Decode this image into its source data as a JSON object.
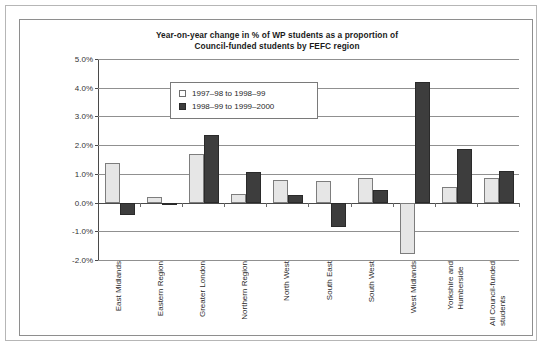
{
  "chart_data": {
    "type": "bar",
    "title": "Year-on-year change in % of WP students as a proportion of Council-funded students by FEFC region",
    "title_line1": "Year-on-year change in % of WP students as a proportion of",
    "title_line2": "Council-funded students by FEFC region",
    "xlabel": "",
    "ylabel": "",
    "ylim": [
      -2.0,
      5.0
    ],
    "ytick_step": 1.0,
    "yticks": [
      "5.0%",
      "4.0%",
      "3.0%",
      "2.0%",
      "1.0%",
      "0.0%",
      "-1.0%",
      "-2.0%"
    ],
    "ytick_values": [
      5.0,
      4.0,
      3.0,
      2.0,
      1.0,
      0.0,
      -1.0,
      -2.0
    ],
    "grid": true,
    "legend_position": "upper-left-inside",
    "categories": [
      "East Midlands",
      "Eastern Region",
      "Greater London",
      "Northern Region",
      "North West",
      "South East",
      "South West",
      "West Midlands",
      "Yorkshire and Humberside",
      "All Council-funded students"
    ],
    "category_lines": [
      [
        "East Midlands"
      ],
      [
        "Eastern Region"
      ],
      [
        "Greater London"
      ],
      [
        "Northern Region"
      ],
      [
        "North West"
      ],
      [
        "South East"
      ],
      [
        "South West"
      ],
      [
        "West Midlands"
      ],
      [
        "Yorkshire and",
        "Humberside"
      ],
      [
        "All Council-funded",
        "students"
      ]
    ],
    "series": [
      {
        "name": "1997–98 to 1998–99",
        "color": "#e6e6e6",
        "values": [
          1.37,
          0.2,
          1.7,
          0.3,
          0.8,
          0.75,
          0.85,
          -1.8,
          0.55,
          0.85
        ]
      },
      {
        "name": "1998–99 to 1999–2000",
        "color": "#3d3d3d",
        "values": [
          -0.45,
          -0.1,
          2.35,
          1.05,
          0.25,
          -0.85,
          0.45,
          4.2,
          1.85,
          1.1
        ]
      }
    ]
  }
}
